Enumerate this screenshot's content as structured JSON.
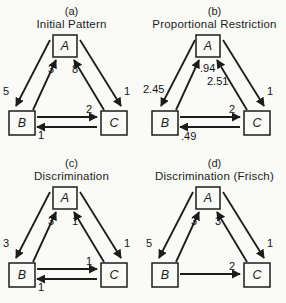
{
  "figure": {
    "background": "#fafaf8",
    "ink": "#1c1c1c",
    "panels": [
      {
        "tag": "(a)",
        "title": "Initial Pattern",
        "nodes": {
          "top": "A",
          "left": "B",
          "right": "C"
        },
        "edges": {
          "a_to_b": "5",
          "b_to_a": "3",
          "c_to_a": "8",
          "a_to_c": "1",
          "b_to_c": "2",
          "c_to_b": "1"
        }
      },
      {
        "tag": "(b)",
        "title": "Proportional Restriction",
        "nodes": {
          "top": "A",
          "left": "B",
          "right": "C"
        },
        "edges": {
          "a_to_b": "2.45",
          "b_to_a": ".94",
          "c_to_a": "2.51",
          "a_to_c": "1",
          "b_to_c": "2",
          "c_to_b": ".49"
        }
      },
      {
        "tag": "(c)",
        "title": "Discrimination",
        "nodes": {
          "top": "A",
          "left": "B",
          "right": "C"
        },
        "edges": {
          "a_to_b": "3",
          "b_to_a": "3",
          "c_to_a": "1",
          "a_to_c": "1",
          "b_to_c": "1",
          "c_to_b": "1"
        }
      },
      {
        "tag": "(d)",
        "title": "Discrimination (Frisch)",
        "nodes": {
          "top": "A",
          "left": "B",
          "right": "C"
        },
        "edges": {
          "a_to_b": "5",
          "b_to_a": "3",
          "c_to_a": "3",
          "a_to_c": "1",
          "b_to_c": "2"
        }
      }
    ]
  }
}
